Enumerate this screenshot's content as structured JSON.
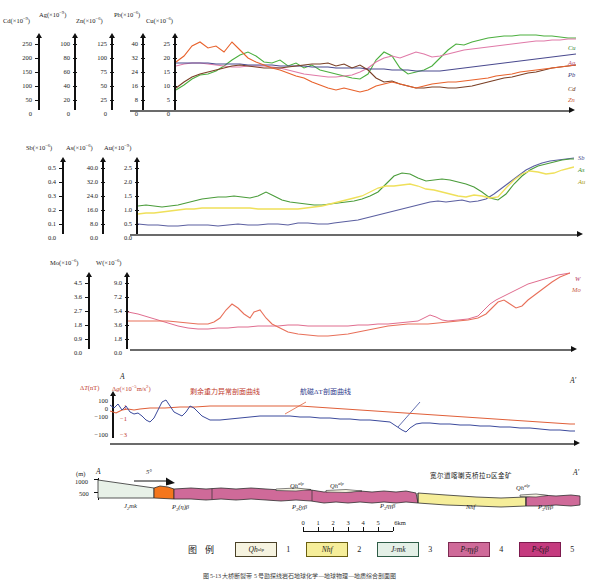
{
  "figure": {
    "caption": "图 5-13  大桥断裂带 5 号勘探线岩石地球化学—地球物理—地质综合剖面图"
  },
  "panels": [
    {
      "id": "panel-ore-elements",
      "axes": [
        {
          "name": "Cd",
          "label": "Cd(×10",
          "exp": "-9",
          ")": ")",
          "ticks": [
            "250",
            "200",
            "150",
            "100",
            "50",
            "0"
          ]
        },
        {
          "name": "Ag",
          "label": "Ag(×10",
          "exp": "-9",
          "ticks": [
            "100",
            "80",
            "60",
            "40",
            "20",
            "0"
          ]
        },
        {
          "name": "Zn",
          "label": "Zn(×10",
          "exp": "-6",
          "ticks": [
            "125",
            "100",
            "75",
            "50",
            "25",
            "0"
          ]
        },
        {
          "name": "Pb",
          "label": "Pb(×10",
          "exp": "-6",
          "ticks": [
            "40",
            "32",
            "24",
            "16",
            "8",
            "0"
          ]
        },
        {
          "name": "Cu",
          "label": "Cu(×10",
          "exp": "-6",
          "ticks": [
            "25",
            "20",
            "15",
            "10",
            "5",
            "0"
          ]
        }
      ],
      "series_labels": [
        "Cu",
        "Ag",
        "Pb",
        "Cd",
        "Zn"
      ]
    },
    {
      "id": "panel-sb-as-au",
      "axes": [
        {
          "name": "Sb",
          "label": "Sb(×10",
          "exp": "-6",
          "ticks": [
            "0.5",
            "0.4",
            "0.3",
            "0.2",
            "0.1",
            "0.0"
          ]
        },
        {
          "name": "As",
          "label": "As(×10",
          "exp": "-6",
          "ticks": [
            "40.0",
            "32.0",
            "24.0",
            "16.0",
            "8.0",
            "0.0"
          ]
        },
        {
          "name": "Au",
          "label": "Au(×10",
          "exp": "-9",
          "ticks": [
            "2.5",
            "2.0",
            "1.5",
            "1.0",
            "0.5",
            "0.0"
          ]
        }
      ],
      "series_labels": [
        "Sb",
        "As",
        "Au"
      ]
    },
    {
      "id": "panel-mo-w",
      "axes": [
        {
          "name": "Mo",
          "label": "Mo(×10",
          "exp": "-6",
          "ticks": [
            "4.5",
            "3.6",
            "2.7",
            "1.8",
            "0.9",
            "0.0"
          ]
        },
        {
          "name": "W",
          "label": "W(×10",
          "exp": "-6",
          "ticks": [
            "9.0",
            "7.2",
            "5.4",
            "3.6",
            "1.8",
            "0.0"
          ]
        }
      ],
      "series_labels": [
        "W",
        "Mo"
      ]
    },
    {
      "id": "panel-geophysics",
      "axis_label_magnetic": "ΔT(nT)",
      "axis_label_gravity": "Δg(×10",
      "axis_label_gravity_exp": "-5",
      "axis_label_gravity_unit": "m/s²)",
      "ticks_magnetic": [
        "100",
        "0",
        "-100",
        "-100"
      ],
      "ticks_gravity": [
        "1",
        "-1",
        "-3"
      ],
      "annotation_gravity": "剩余重力异常剖面曲线",
      "annotation_magnetic": "航磁ΔT剖面曲线",
      "section_start": "A",
      "section_end": "A′"
    }
  ],
  "cross_section": {
    "id": "panel-cross-section",
    "unit_label": "(m)",
    "start": "A",
    "end": "A′",
    "elevations": [
      "1000",
      "500"
    ],
    "dip_label": "5°",
    "deposit_label": "宽尔道喀喇克桥拉D区金矿",
    "unit_annotations": [
      {
        "text": "J₂mk",
        "x": 170,
        "y": 513
      },
      {
        "text": "P₃(η)β",
        "x": 263,
        "y": 513
      },
      {
        "text": "Qh",
        "sup": "alp",
        "x": 290,
        "y": 491
      },
      {
        "text": "Qh",
        "sup": "alp",
        "x": 325,
        "y": 491
      },
      {
        "text": "P₂ξγβ",
        "x": 300,
        "y": 510
      },
      {
        "text": "P₃ηγβ",
        "x": 295,
        "y": 516
      },
      {
        "text": "Nh",
        "x": 466,
        "y": 513
      },
      {
        "text": "Qh",
        "sup": "alp",
        "x": 520,
        "y": 495
      },
      {
        "text": "P₃ηγβ",
        "x": 545,
        "y": 514
      }
    ]
  },
  "scalebar": {
    "ticks": [
      "0",
      "1",
      "2",
      "3",
      "4",
      "5",
      "6km"
    ]
  },
  "legend": {
    "title": "图  例",
    "items": [
      {
        "code": "Qh",
        "sup": "alp",
        "num": "1",
        "color": "#f6f3e0",
        "border": "#4a4127"
      },
      {
        "code": "Nh",
        "sub": "f",
        "num": "2",
        "color": "#f6ee9a",
        "border": "#6a5f10"
      },
      {
        "code": "J",
        "sub": "2",
        "italic": "mk",
        "num": "3",
        "color": "#e4f0e7",
        "border": "#2f5c47"
      },
      {
        "code": "P",
        "sub": "3",
        "italic": "ηγβ",
        "num": "4",
        "color": "#cf6a99",
        "border": "#7d2a52"
      },
      {
        "code": "P",
        "sub": "3",
        "italic": "ξγβ",
        "num": "5",
        "color": "#c53b7f",
        "border": "#7d1a4e"
      }
    ]
  },
  "colors": {
    "cu": "#4caf3f",
    "ag": "#e07aa8",
    "pb": "#4a4a8f",
    "cd": "#7a3f25",
    "zn": "#e8622c",
    "sb": "#5b5fa0",
    "as": "#4a9c3a",
    "au": "#efe05a",
    "w": "#d96a6a",
    "mo": "#e8705a",
    "gravity": "#e0603a",
    "magnetic": "#3b4a9c",
    "qh": "#f6f3e0",
    "nh": "#f6ee9a",
    "jmk": "#e4f0e7",
    "p3etagb": "#cf6a99",
    "p3xigb": "#c53b7f",
    "intrusive": "#f4761c"
  }
}
